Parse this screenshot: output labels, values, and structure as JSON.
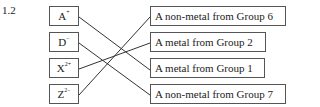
{
  "question_number": "1.2",
  "ions": [
    {
      "symbol": "A",
      "charge": "+"
    },
    {
      "symbol": "D",
      "charge": "−"
    },
    {
      "symbol": "X",
      "charge": "2+"
    },
    {
      "symbol": "Z",
      "charge": "2−"
    }
  ],
  "descriptions": [
    {
      "label": "A non-metal from Group 6"
    },
    {
      "label": "A metal from Group 2"
    },
    {
      "label": "A metal from Group 1"
    },
    {
      "label": "A non-metal from Group 7"
    }
  ],
  "matches": [
    {
      "ion": "A+",
      "description": "A metal from Group 1"
    },
    {
      "ion": "D−",
      "description": "A non-metal from Group 7"
    },
    {
      "ion": "X2+",
      "description": "A metal from Group 2"
    },
    {
      "ion": "Z2−",
      "description": "A non-metal from Group 6"
    }
  ],
  "colors": {
    "line": "#333333",
    "border": "#555555"
  }
}
